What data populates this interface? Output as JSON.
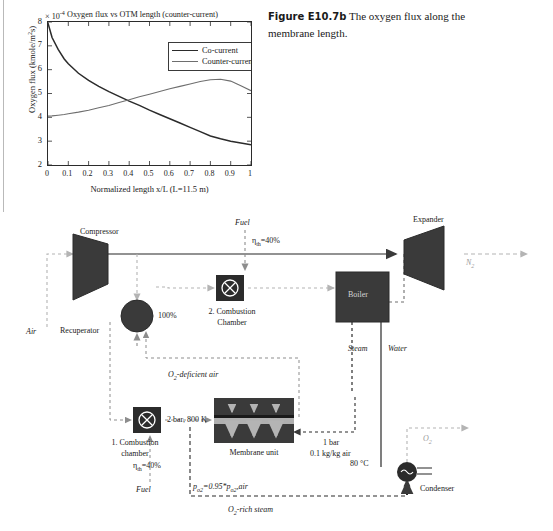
{
  "caption": {
    "label": "Figure E10.7b",
    "text": "The oxygen flux along the membrane length."
  },
  "chart_data": {
    "type": "line",
    "title": "Oxygen flux vs OTM length (counter-current)",
    "multiplier": "× 10",
    "multiplier_exp": "-4",
    "xlabel": "Normalized length x/L (L=11.5 m)",
    "ylabel_pre": "Oxygen flux (kmole/m",
    "ylabel_sup": "2",
    "ylabel_post": "s)",
    "xlim": [
      0,
      1
    ],
    "ylim": [
      2,
      8
    ],
    "xticks": [
      "0",
      "0.1",
      "0.2",
      "0.3",
      "0.4",
      "0.5",
      "0.6",
      "0.7",
      "0.8",
      "0.9",
      "1"
    ],
    "yticks": [
      "2",
      "3",
      "4",
      "5",
      "6",
      "7",
      "8"
    ],
    "grid": false,
    "legend_position": "top-right",
    "x": [
      0,
      0.02,
      0.05,
      0.08,
      0.1,
      0.15,
      0.2,
      0.25,
      0.3,
      0.35,
      0.4,
      0.45,
      0.5,
      0.55,
      0.6,
      0.65,
      0.7,
      0.75,
      0.8,
      0.85,
      0.9,
      0.95,
      1.0
    ],
    "series": [
      {
        "name": "Co-current",
        "color": "#2b2b2b",
        "values": [
          7.95,
          7.35,
          6.85,
          6.45,
          6.25,
          5.85,
          5.55,
          5.3,
          5.08,
          4.88,
          4.68,
          4.5,
          4.3,
          4.12,
          3.94,
          3.76,
          3.58,
          3.4,
          3.22,
          3.1,
          3.0,
          2.92,
          2.85
        ]
      },
      {
        "name": "Counter-current",
        "color": "#6e6e6e",
        "values": [
          4.05,
          4.06,
          4.09,
          4.12,
          4.15,
          4.22,
          4.3,
          4.4,
          4.5,
          4.62,
          4.74,
          4.86,
          4.97,
          5.08,
          5.2,
          5.3,
          5.4,
          5.5,
          5.58,
          5.6,
          5.52,
          5.32,
          5.12
        ]
      }
    ]
  },
  "flowsheet": {
    "units": {
      "compressor": "Compressor",
      "expander": "Expander",
      "recuperator": "Recuperator",
      "recuperator_eff": "100%",
      "boiler": "Boiler",
      "condenser": "Condenser",
      "membrane_unit": "Membrane unit",
      "combustion_1_line1": "1. Combustion",
      "combustion_1_line2": "chamber",
      "combustion_2_line1": "2. Combustion",
      "combustion_2_line2": "Chamber"
    },
    "streams": {
      "air": "Air",
      "fuel_top": "Fuel",
      "fuel_bottom": "Fuel",
      "nitrogen": "N",
      "nitrogen_sub": "2",
      "oxygen": "O",
      "oxygen_sub": "2",
      "steam": "Steam",
      "water": "Water",
      "o2_deficient_pre": "O",
      "o2_deficient_sub": "2",
      "o2_deficient_post": "-deficient air",
      "o2_rich_pre": "O",
      "o2_rich_sub": "2",
      "o2_rich_post": "-rich steam"
    },
    "conditions": {
      "eta_th_top_pre": "η",
      "eta_th_top_sub": "th",
      "eta_th_top_post": "=40%",
      "eta_th_bottom_pre": "η",
      "eta_th_bottom_sub": "th",
      "eta_th_bottom_post": "=40%",
      "membrane_feed": "2 bar, 800 K",
      "sweep_line1": "1 bar",
      "sweep_line2": "0.1 kg/kg air",
      "condenser_temp": "80 °C",
      "po2_pre": "p",
      "po2_sub1": "o2",
      "po2_mid": "=0.95*p",
      "po2_sub2": "o2",
      "po2_post": ",air"
    }
  },
  "colors": {
    "dark": "#2b2b2b",
    "mid_gray": "#6e6e6e",
    "light_gray": "#9a9a9a",
    "unit_fill": "#3a3a3a",
    "membrane_strip": "#b0b0b0"
  }
}
